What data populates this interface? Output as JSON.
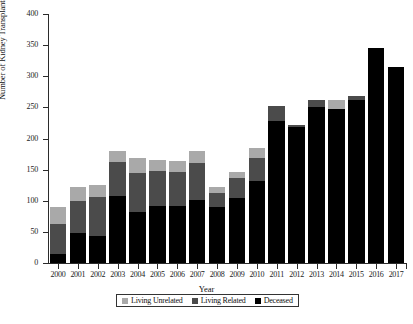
{
  "chart_data": {
    "type": "bar",
    "stacked": true,
    "title": "",
    "xlabel": "Year",
    "ylabel": "Number of Kidney Transplantations",
    "ylim": [
      0,
      400
    ],
    "ytick_values": [
      0,
      50,
      100,
      150,
      200,
      250,
      300,
      350,
      400
    ],
    "ytick_labels": [
      "0",
      "50",
      "100",
      "150",
      "200",
      "250",
      "300",
      "350",
      "400"
    ],
    "grid": false,
    "legend_position": "bottom",
    "categories": [
      "2000",
      "2001",
      "2002",
      "2003",
      "2004",
      "2005",
      "2006",
      "2007",
      "2008",
      "2009",
      "2010",
      "2011",
      "2012",
      "2013",
      "2014",
      "2015",
      "2016",
      "2017"
    ],
    "series": [
      {
        "name": "Deceased",
        "color": "#000000",
        "values": [
          14,
          48,
          44,
          108,
          82,
          92,
          92,
          102,
          90,
          104,
          132,
          228,
          218,
          250,
          248,
          262,
          345,
          315
        ]
      },
      {
        "name": "Living Related",
        "color": "#4b4b4b",
        "values": [
          48,
          52,
          62,
          54,
          62,
          56,
          54,
          58,
          22,
          32,
          36,
          24,
          4,
          12,
          0,
          6,
          0,
          0
        ]
      },
      {
        "name": "Living Unrelated",
        "color": "#a9a9a9",
        "values": [
          28,
          22,
          20,
          18,
          24,
          18,
          18,
          20,
          10,
          10,
          17,
          0,
          0,
          0,
          14,
          0,
          0,
          0
        ]
      }
    ],
    "totals": [
      90,
      122,
      126,
      180,
      168,
      166,
      164,
      180,
      122,
      146,
      185,
      252,
      222,
      262,
      262,
      268,
      345,
      315
    ]
  },
  "legend": {
    "items": [
      {
        "label": "Living Unrelated",
        "color": "#a9a9a9"
      },
      {
        "label": "Living Related",
        "color": "#4b4b4b"
      },
      {
        "label": "Deceased",
        "color": "#000000"
      }
    ]
  }
}
